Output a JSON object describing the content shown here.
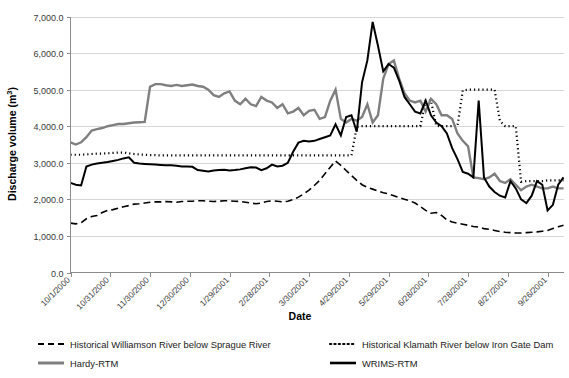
{
  "chart_data": {
    "type": "line",
    "title": "",
    "xlabel": "Date",
    "ylabel": "Discharge volume (m3)",
    "ylabel_display": "Discharge volume (m",
    "ylabel_sup": "3",
    "ylabel_tail": ")",
    "ylim": [
      0,
      7000
    ],
    "ytick_labels": [
      "0.0",
      "1,000.0",
      "2,000.0",
      "3,000.0",
      "4,000.0",
      "5,000.0",
      "6,000.0",
      "7,000.0"
    ],
    "ytick_values": [
      0,
      1000,
      2000,
      3000,
      4000,
      5000,
      6000,
      7000
    ],
    "grid": true,
    "legend_position": "bottom",
    "xtick_labels": [
      "10/1/2000",
      "10/31/2000",
      "11/30/2000",
      "12/30/2000",
      "1/29/2001",
      "2/28/2001",
      "3/30/2001",
      "4/29/2001",
      "5/29/2001",
      "6/28/2001",
      "7/28/2001",
      "8/27/2001",
      "9/26/2001"
    ],
    "xtick_positions": [
      0,
      30,
      60,
      90,
      120,
      150,
      180,
      210,
      240,
      270,
      300,
      330,
      360
    ],
    "x_range": [
      0,
      372
    ],
    "x_unit": "days since 10/1/2000",
    "series": [
      {
        "name": "Historical Williamson River below Sprague River",
        "key": "williamson",
        "color": "#000000",
        "style": "dashed",
        "width": 1.6,
        "x": [
          0,
          4,
          8,
          12,
          16,
          20,
          24,
          28,
          32,
          36,
          40,
          44,
          48,
          52,
          56,
          60,
          64,
          68,
          72,
          76,
          80,
          84,
          88,
          92,
          96,
          100,
          104,
          108,
          112,
          116,
          120,
          124,
          128,
          132,
          136,
          140,
          144,
          148,
          152,
          156,
          160,
          164,
          168,
          172,
          176,
          180,
          184,
          188,
          192,
          196,
          200,
          204,
          208,
          212,
          216,
          220,
          224,
          228,
          232,
          236,
          240,
          244,
          248,
          252,
          256,
          260,
          264,
          268,
          272,
          276,
          280,
          284,
          288,
          292,
          296,
          300,
          304,
          308,
          312,
          316,
          320,
          324,
          328,
          332,
          336,
          340,
          344,
          348,
          352,
          356,
          360,
          364,
          368,
          372
        ],
        "values": [
          1350,
          1330,
          1360,
          1470,
          1530,
          1560,
          1640,
          1700,
          1720,
          1760,
          1800,
          1830,
          1870,
          1880,
          1900,
          1920,
          1930,
          1930,
          1940,
          1930,
          1920,
          1940,
          1950,
          1950,
          1960,
          1960,
          1950,
          1940,
          1950,
          1960,
          1960,
          1950,
          1940,
          1920,
          1900,
          1880,
          1900,
          1940,
          1960,
          1950,
          1930,
          1950,
          2000,
          2060,
          2150,
          2250,
          2380,
          2520,
          2700,
          2880,
          3050,
          2930,
          2790,
          2650,
          2520,
          2400,
          2330,
          2280,
          2230,
          2180,
          2150,
          2100,
          2050,
          2000,
          1960,
          1900,
          1800,
          1700,
          1620,
          1640,
          1560,
          1440,
          1380,
          1350,
          1320,
          1290,
          1260,
          1240,
          1200,
          1180,
          1150,
          1120,
          1100,
          1090,
          1080,
          1080,
          1090,
          1100,
          1110,
          1130,
          1150,
          1200,
          1250,
          1290
        ]
      },
      {
        "name": "Historical Klamath River below Iron Gate Dam",
        "key": "klamath",
        "color": "#000000",
        "style": "dotted",
        "width": 2.2,
        "x": [
          0,
          4,
          8,
          12,
          16,
          20,
          24,
          28,
          32,
          36,
          40,
          44,
          48,
          52,
          56,
          60,
          64,
          68,
          72,
          76,
          80,
          84,
          88,
          92,
          96,
          100,
          104,
          108,
          112,
          116,
          120,
          124,
          128,
          132,
          136,
          140,
          144,
          148,
          152,
          156,
          160,
          164,
          168,
          172,
          176,
          180,
          184,
          188,
          192,
          196,
          200,
          204,
          208,
          212,
          216,
          220,
          224,
          228,
          232,
          236,
          240,
          244,
          248,
          252,
          256,
          260,
          264,
          268,
          272,
          276,
          280,
          284,
          288,
          292,
          296,
          300,
          304,
          308,
          312,
          316,
          320,
          324,
          328,
          332,
          336,
          340,
          344,
          348,
          352,
          356,
          360,
          364,
          368,
          372
        ],
        "values": [
          3220,
          3220,
          3220,
          3230,
          3240,
          3250,
          3250,
          3260,
          3270,
          3280,
          3280,
          3260,
          3240,
          3230,
          3220,
          3210,
          3210,
          3200,
          3200,
          3200,
          3200,
          3200,
          3200,
          3200,
          3200,
          3200,
          3200,
          3200,
          3200,
          3200,
          3200,
          3200,
          3200,
          3200,
          3200,
          3200,
          3200,
          3200,
          3200,
          3200,
          3200,
          3200,
          3200,
          3200,
          3200,
          3200,
          3200,
          3200,
          3200,
          3200,
          3200,
          3200,
          3200,
          3200,
          3980,
          4000,
          4000,
          4000,
          4000,
          4000,
          4000,
          4000,
          4000,
          4000,
          4000,
          4000,
          4000,
          4700,
          4700,
          4010,
          4000,
          4000,
          4000,
          4000,
          4980,
          5000,
          5000,
          5000,
          5000,
          5000,
          5000,
          4150,
          4000,
          4000,
          4000,
          2480,
          2500,
          2500,
          2500,
          2500,
          2520,
          2520,
          2520,
          2520
        ]
      },
      {
        "name": "Hardy-RTM",
        "key": "hardy",
        "color": "#7f7f7f",
        "style": "solid",
        "width": 2.4,
        "x": [
          0,
          4,
          8,
          12,
          16,
          20,
          24,
          28,
          32,
          36,
          40,
          44,
          48,
          52,
          56,
          60,
          64,
          68,
          72,
          76,
          80,
          84,
          88,
          92,
          96,
          100,
          104,
          108,
          112,
          116,
          120,
          124,
          128,
          132,
          136,
          140,
          144,
          148,
          152,
          156,
          160,
          164,
          168,
          172,
          176,
          180,
          184,
          188,
          192,
          196,
          200,
          204,
          208,
          212,
          216,
          220,
          224,
          228,
          232,
          236,
          240,
          244,
          248,
          252,
          256,
          260,
          264,
          268,
          272,
          276,
          280,
          284,
          288,
          292,
          296,
          300,
          304,
          308,
          312,
          316,
          320,
          324,
          328,
          332,
          336,
          340,
          344,
          348,
          352,
          356,
          360,
          364,
          368,
          372
        ],
        "values": [
          3560,
          3500,
          3560,
          3700,
          3880,
          3920,
          3950,
          4000,
          4030,
          4060,
          4060,
          4080,
          4100,
          4110,
          4120,
          5080,
          5150,
          5150,
          5120,
          5100,
          5130,
          5100,
          5120,
          5140,
          5100,
          5080,
          5000,
          4850,
          4800,
          4900,
          4950,
          4700,
          4600,
          4750,
          4600,
          4550,
          4800,
          4700,
          4650,
          4500,
          4600,
          4350,
          4400,
          4500,
          4300,
          4420,
          4450,
          4200,
          4250,
          4700,
          5000,
          4200,
          4100,
          4200,
          4150,
          4250,
          4600,
          4100,
          4300,
          5300,
          5700,
          5800,
          5300,
          4900,
          4700,
          4650,
          4700,
          4400,
          4750,
          4600,
          4300,
          4300,
          4200,
          3800,
          3600,
          3450,
          2600,
          2580,
          2550,
          2600,
          2700,
          2500,
          2450,
          2550,
          2400,
          2250,
          2350,
          2400,
          2350,
          2300,
          2300,
          2350,
          2300,
          2300
        ]
      },
      {
        "name": "WRIMS-RTM",
        "key": "wrims",
        "color": "#000000",
        "style": "solid",
        "width": 2.0,
        "x": [
          0,
          4,
          8,
          12,
          16,
          20,
          24,
          28,
          32,
          36,
          40,
          44,
          48,
          52,
          56,
          60,
          64,
          68,
          72,
          76,
          80,
          84,
          88,
          92,
          96,
          100,
          104,
          108,
          112,
          116,
          120,
          124,
          128,
          132,
          136,
          140,
          144,
          148,
          152,
          156,
          160,
          164,
          168,
          172,
          176,
          180,
          184,
          188,
          192,
          196,
          200,
          204,
          208,
          212,
          216,
          220,
          224,
          228,
          232,
          236,
          240,
          244,
          248,
          252,
          256,
          260,
          264,
          268,
          272,
          276,
          280,
          284,
          288,
          292,
          296,
          300,
          304,
          308,
          312,
          316,
          320,
          324,
          328,
          332,
          336,
          340,
          344,
          348,
          352,
          356,
          360,
          364,
          368,
          372
        ],
        "values": [
          2450,
          2400,
          2380,
          2900,
          2950,
          2980,
          3000,
          3020,
          3050,
          3080,
          3120,
          3150,
          3000,
          2980,
          2970,
          2960,
          2950,
          2940,
          2930,
          2930,
          2920,
          2900,
          2900,
          2890,
          2800,
          2780,
          2760,
          2790,
          2800,
          2810,
          2790,
          2800,
          2820,
          2850,
          2880,
          2870,
          2800,
          2850,
          2950,
          2900,
          2920,
          3000,
          3300,
          3550,
          3600,
          3580,
          3600,
          3650,
          3700,
          3750,
          4050,
          3750,
          4250,
          4300,
          3850,
          5200,
          5800,
          6850,
          6200,
          5500,
          5700,
          5600,
          5250,
          4800,
          4600,
          4400,
          4350,
          4700,
          4300,
          4100,
          4000,
          3800,
          3400,
          3100,
          2750,
          2700,
          2600,
          4700,
          2600,
          2350,
          2200,
          2100,
          2050,
          2500,
          2300,
          2000,
          1900,
          2100,
          2500,
          2400,
          1700,
          1850,
          2400,
          2600
        ]
      }
    ]
  },
  "legend": {
    "items": [
      {
        "label": "Historical Williamson River below Sprague River",
        "style": "dashed",
        "color": "#000000"
      },
      {
        "label": "Historical Klamath River below Iron Gate Dam",
        "style": "dotted",
        "color": "#000000"
      },
      {
        "label": "Hardy-RTM",
        "style": "solid-gray",
        "color": "#7f7f7f"
      },
      {
        "label": "WRIMS-RTM",
        "style": "solid-black",
        "color": "#000000"
      }
    ]
  }
}
